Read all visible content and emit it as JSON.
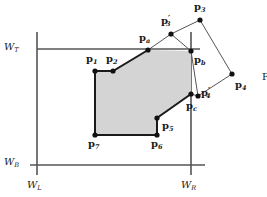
{
  "figure": {
    "colors": {
      "fill": "#d4d4d4",
      "stroke_thick": "#1a1a1a",
      "stroke_thin": "#555555",
      "window_line": "#555555",
      "vertex": "#111111",
      "background": "#ffffff"
    },
    "window": {
      "left_label": "W",
      "left_sub": "L",
      "right_label": "W",
      "right_sub": "R",
      "top_label": "W",
      "top_sub": "T",
      "bottom_label": "W",
      "bottom_sub": "B",
      "x_left": 37,
      "x_right": 191,
      "y_top": 49,
      "y_bottom": 165
    },
    "caption_fragment": "F",
    "vertices": [
      {
        "id": "p1",
        "base": "p",
        "sub": "1",
        "prime": false,
        "x": 95,
        "y": 71,
        "label_x": 86,
        "label_y": 54,
        "dot": true
      },
      {
        "id": "p2",
        "base": "p",
        "sub": "2",
        "prime": false,
        "x": 113,
        "y": 71,
        "label_x": 106,
        "label_y": 54,
        "dot": true
      },
      {
        "id": "pa",
        "base": "p",
        "sub": "a",
        "prime": false,
        "x": 148,
        "y": 50,
        "label_x": 139,
        "label_y": 33,
        "dot": true
      },
      {
        "id": "p3p",
        "base": "p",
        "sub": "3",
        "prime": true,
        "x": 171,
        "y": 34,
        "label_x": 161,
        "label_y": 16,
        "dot": true
      },
      {
        "id": "p3",
        "base": "p",
        "sub": "3",
        "prime": false,
        "x": 200,
        "y": 20,
        "label_x": 194,
        "label_y": 2,
        "dot": true
      },
      {
        "id": "pb",
        "base": "p",
        "sub": "b",
        "prime": false,
        "x": 191,
        "y": 51,
        "label_x": 194,
        "label_y": 55,
        "dot": true
      },
      {
        "id": "p4",
        "base": "p",
        "sub": "4",
        "prime": false,
        "x": 232,
        "y": 74,
        "label_x": 235,
        "label_y": 80,
        "dot": true
      },
      {
        "id": "p4p",
        "base": "p",
        "sub": "4",
        "prime": true,
        "x": 198,
        "y": 96,
        "label_x": 201,
        "label_y": 88,
        "dot": true
      },
      {
        "id": "pc",
        "base": "p",
        "sub": "c",
        "prime": false,
        "x": 191,
        "y": 94,
        "label_x": 186,
        "label_y": 101,
        "dot": true
      },
      {
        "id": "p5",
        "base": "p",
        "sub": "5",
        "prime": false,
        "x": 157,
        "y": 118,
        "label_x": 162,
        "label_y": 121,
        "dot": true
      },
      {
        "id": "p6",
        "base": "p",
        "sub": "6",
        "prime": false,
        "x": 157,
        "y": 135,
        "label_x": 151,
        "label_y": 139,
        "dot": true
      },
      {
        "id": "p7",
        "base": "p",
        "sub": "7",
        "prime": false,
        "x": 95,
        "y": 135,
        "label_x": 88,
        "label_y": 139,
        "dot": true
      }
    ],
    "clipped_polygon_path": "M 95,71 L 113,71 L 148,50 L 191,51 L 191,94 L 157,118 L 157,135 L 95,135 Z",
    "thick_outline_path": "M 95,71 L 113,71 L 148,50 M 191,94 L 157,118 L 157,135 L 95,135 L 95,71",
    "thin_outline_path": "M 148,50 L 171,34 L 200,20 L 232,74 L 198,96 L 191,94",
    "thin_clip_edge_path": "M 171,34 L 191,51 L 198,96",
    "window_lines": [
      {
        "name": "w-top-line",
        "x1": 37,
        "y1": 49,
        "x2": 200,
        "y2": 49
      },
      {
        "name": "w-bottom-line",
        "x1": 30,
        "y1": 165,
        "x2": 205,
        "y2": 165
      },
      {
        "name": "w-left-line",
        "x1": 37,
        "y1": 32,
        "x2": 37,
        "y2": 175
      },
      {
        "name": "w-right-line",
        "x1": 191,
        "y1": 32,
        "x2": 191,
        "y2": 175
      }
    ],
    "w_label_positions": {
      "top": {
        "x": 4,
        "y": 42
      },
      "bottom": {
        "x": 4,
        "y": 157
      },
      "left": {
        "x": 27,
        "y": 180
      },
      "right": {
        "x": 181,
        "y": 180
      }
    }
  }
}
